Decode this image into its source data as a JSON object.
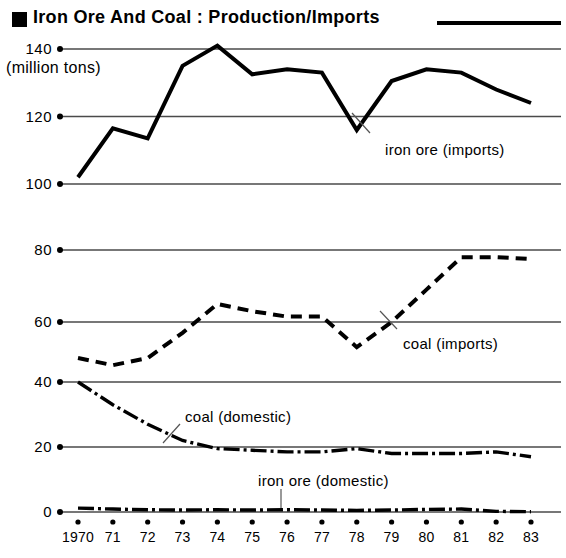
{
  "title": {
    "text": "Iron Ore And Coal : Production/Imports",
    "marker": "filled-square"
  },
  "axis": {
    "unit_label": "(million tons)",
    "panel1_ticks": [
      "140",
      "120",
      "100"
    ],
    "panel2_ticks": [
      "80",
      "60"
    ],
    "panel3_ticks": [
      "40",
      "20",
      "0"
    ],
    "x_labels": [
      "1970",
      "71",
      "72",
      "73",
      "74",
      "75",
      "76",
      "77",
      "78",
      "79",
      "80",
      "81",
      "82",
      "83"
    ]
  },
  "labels": {
    "iron_ore_imports": "iron ore (imports)",
    "coal_imports": "coal (imports)",
    "coal_domestic": "coal (domestic)",
    "iron_ore_domestic": "iron ore (domestic)"
  },
  "colors": {
    "ink": "#000000",
    "gridline": "#4a4a4a",
    "background": "#ffffff",
    "leader": "#555555"
  },
  "chart_data": {
    "type": "line",
    "title": "Iron Ore And Coal : Production/Imports",
    "subtitle": "",
    "xlabel": "",
    "ylabel": "(million tons)",
    "grid": true,
    "legend": "inline-annotations",
    "x": [
      1970,
      1971,
      1972,
      1973,
      1974,
      1975,
      1976,
      1977,
      1978,
      1979,
      1980,
      1981,
      1982,
      1983
    ],
    "x_tick_labels": [
      "1970",
      "71",
      "72",
      "73",
      "74",
      "75",
      "76",
      "77",
      "78",
      "79",
      "80",
      "81",
      "82",
      "83"
    ],
    "panels": [
      {
        "name": "imports-iron-ore",
        "ylim": [
          96,
          146
        ],
        "yticks": [
          100,
          120,
          140
        ],
        "series": [
          {
            "name": "iron ore (imports)",
            "style": "solid",
            "values": [
              102,
              116.5,
              113.5,
              135,
              141,
              132.5,
              134,
              133,
              116,
              130.5,
              134,
              133,
              128,
              124
            ]
          }
        ]
      },
      {
        "name": "imports-coal",
        "ylim": [
          44,
          84
        ],
        "yticks": [
          60,
          80
        ],
        "series": [
          {
            "name": "coal (imports)",
            "style": "dashed",
            "values": [
              50,
              48,
              50,
              57,
              65,
              63,
              61.5,
              61.5,
              53,
              60,
              69,
              78,
              78,
              77.5
            ]
          }
        ]
      },
      {
        "name": "domestic",
        "ylim": [
          -2,
          42
        ],
        "yticks": [
          0,
          20,
          40
        ],
        "series": [
          {
            "name": "coal (domestic)",
            "style": "dash-dot",
            "values": [
              40,
              33,
              27,
              22,
              19.5,
              19,
              18.5,
              18.5,
              19.5,
              18,
              18,
              18,
              18.5,
              17
            ]
          },
          {
            "name": "iron ore (domestic)",
            "style": "dash-dot",
            "values": [
              1.2,
              0.9,
              0.7,
              0.6,
              0.7,
              0.6,
              0.7,
              0.6,
              0.5,
              0.6,
              0.8,
              0.9,
              0.2,
              0.1
            ]
          }
        ]
      }
    ]
  }
}
